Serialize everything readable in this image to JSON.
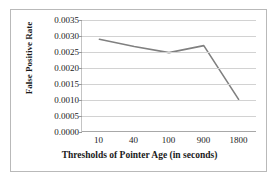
{
  "chart_data": {
    "type": "line",
    "title": "",
    "subtitle": "",
    "xlabel": "Thresholds of Pointer Age (in seconds)",
    "ylabel": "False Positive Rate",
    "categories": [
      "10",
      "40",
      "100",
      "900",
      "1800"
    ],
    "values": [
      0.0029,
      0.00267,
      0.00248,
      0.0027,
      0.00102
    ],
    "series": [
      {
        "name": "False Positive Rate",
        "values": [
          0.0029,
          0.00267,
          0.00248,
          0.0027,
          0.00102
        ]
      }
    ],
    "ylim": [
      0.0,
      0.0035
    ],
    "ytick_labels": [
      "0.0035",
      "0.0030",
      "0.0025",
      "0.0020",
      "0.0015",
      "0.0010",
      "0.0005",
      "0.0000"
    ],
    "ytick_values": [
      0.0035,
      0.003,
      0.0025,
      0.002,
      0.0015,
      0.001,
      0.0005,
      0.0
    ],
    "grid": "horizontal",
    "legend": "none",
    "line_color": "#808080",
    "gridline_color": "#d2d2d2",
    "axis_color": "#a8a8a8",
    "border_color": "#b9b9b9",
    "background": "#ffffff",
    "text_color": "#1a1a1a",
    "markers": false
  }
}
